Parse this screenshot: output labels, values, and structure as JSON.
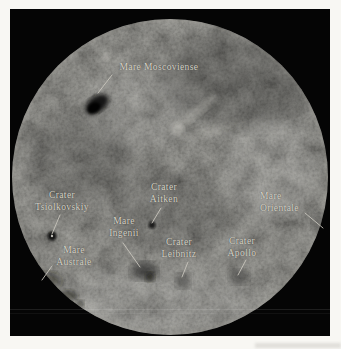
{
  "figure": {
    "description": "Photograph of the far side of the Moon with labeled features",
    "frame_color": "#050505",
    "moon_base_color": "#3c3b37",
    "label_color": "#d8d4c9",
    "page_background": "#f8f7f3"
  },
  "labels": [
    {
      "name": "mare-moscoviense",
      "lines": [
        "Mare Moscoviense"
      ]
    },
    {
      "name": "crater-tsiolkovskiy",
      "lines": [
        "Crater",
        "Tsiolkovskiy"
      ]
    },
    {
      "name": "crater-aitken",
      "lines": [
        "Crater",
        "Aitken"
      ]
    },
    {
      "name": "mare-orientale",
      "lines": [
        "Mare",
        "Orientale"
      ]
    },
    {
      "name": "mare-ingenii",
      "lines": [
        "Mare",
        "Ingenii"
      ]
    },
    {
      "name": "crater-leibnitz",
      "lines": [
        "Crater",
        "Leibnitz"
      ]
    },
    {
      "name": "crater-apollo",
      "lines": [
        "Crater",
        "Apollo"
      ]
    },
    {
      "name": "mare-australe",
      "lines": [
        "Mare",
        "Australe"
      ]
    }
  ]
}
